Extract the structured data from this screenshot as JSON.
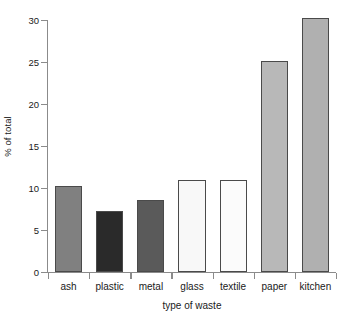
{
  "chart_data": {
    "type": "bar",
    "title": "",
    "xlabel": "type of waste",
    "ylabel": "% of total",
    "categories": [
      "ash",
      "plastic",
      "metal",
      "glass",
      "textile",
      "paper",
      "kitchen"
    ],
    "values": [
      10.3,
      7.3,
      8.6,
      10.9,
      10.9,
      25.1,
      30.2
    ],
    "bar_colors": [
      "#808080",
      "#2a2a2a",
      "#5a5a5a",
      "#f8f8f8",
      "#fbfbfb",
      "#b8b8b8",
      "#b0b0b0"
    ],
    "bar_border_color": "#4a4a4a",
    "ylim": [
      0,
      30
    ],
    "ytick_values": [
      0,
      5,
      10,
      15,
      20,
      25,
      30
    ],
    "ytick_labels": [
      "0",
      "5",
      "10",
      "15",
      "20",
      "25",
      "30"
    ],
    "grid": false,
    "legend": false,
    "legend_position": "none",
    "axis_color": "#8b8b8b",
    "background_color": "#ffffff"
  }
}
